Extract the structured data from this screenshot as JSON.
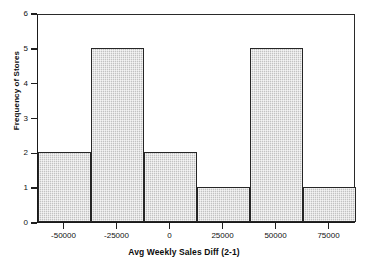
{
  "chart_data": {
    "type": "bar",
    "title": "",
    "subtitle": "",
    "xlabel": "Avg Weekly Sales Diff (2-1)",
    "ylabel": "Frequency of Stores",
    "categories": [
      "-62500 to -37500",
      "-37500 to -12500",
      "-12500 to 12500",
      "12500 to 37500",
      "37500 to 62500",
      "62500 to 87500"
    ],
    "values": [
      2,
      5,
      2,
      1,
      5,
      1
    ],
    "bin_edges": [
      -62500,
      -37500,
      -12500,
      12500,
      37500,
      62500,
      87500
    ],
    "bin_width": 25000,
    "xlim": [
      -62500,
      87500
    ],
    "ylim": [
      0,
      6
    ],
    "x_ticks": [
      -50000,
      -25000,
      0,
      25000,
      50000,
      75000
    ],
    "x_tick_labels": [
      "-50000",
      "-25000",
      "0",
      "25000",
      "50000",
      "75000"
    ],
    "y_ticks": [
      0,
      1,
      2,
      3,
      4,
      5,
      6
    ],
    "y_tick_labels": [
      "0",
      "1",
      "2",
      "3",
      "4",
      "5",
      "6"
    ],
    "grid": false,
    "legend": false,
    "legend_position": "none",
    "bar_fill_color": "#d2d2d2",
    "bar_edge_color": "#262626",
    "axis_color": "#1a1a1a",
    "background_color": "#ffffff"
  }
}
